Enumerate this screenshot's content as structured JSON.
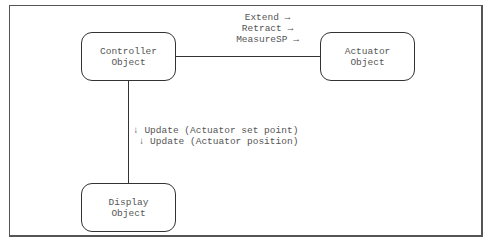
{
  "diagram": {
    "nodes": {
      "controller": {
        "line1": "Controller",
        "line2": "Object"
      },
      "actuator": {
        "line1": "Actuator",
        "line2": "Object"
      },
      "display": {
        "line1": "Display",
        "line2": "Object"
      }
    },
    "edges": {
      "controller_to_actuator": {
        "messages": [
          "Extend →",
          "Retract →",
          "MeasureSP →"
        ]
      },
      "controller_to_display": {
        "messages": [
          "↓ Update (Actuator set point)",
          " ↓ Update (Actuator position)"
        ]
      }
    }
  }
}
